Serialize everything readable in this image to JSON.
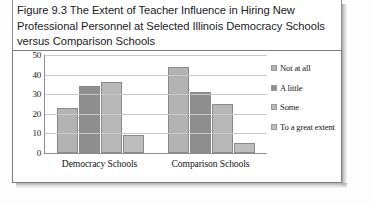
{
  "figure": {
    "caption": "Figure 9.3 The Extent of Teacher Influence in Hiring New Professional Personnel at Selected Illinois Democracy Schools versus Comparison Schools"
  },
  "chart_data": {
    "type": "bar",
    "title": "Figure 9.3 The Extent of Teacher Influence in Hiring New Professional Personnel at Selected Illinois Democracy Schools versus Comparison Schools",
    "xlabel": "",
    "ylabel": "",
    "categories": [
      "Democracy Schools",
      "Comparison Schools"
    ],
    "series": [
      {
        "name": "Not at all",
        "values": [
          23,
          44
        ],
        "color": "#b3b3b3"
      },
      {
        "name": "A little",
        "values": [
          34,
          31
        ],
        "color": "#8e8e8e"
      },
      {
        "name": "Some",
        "values": [
          36,
          25
        ],
        "color": "#b8b8b8"
      },
      {
        "name": "To a great extent",
        "values": [
          9,
          5
        ],
        "color": "#bdbdbd"
      }
    ],
    "ylim": [
      0,
      50
    ],
    "yticks": [
      0,
      10,
      20,
      30,
      40,
      50
    ],
    "ytick_labels": [
      "0",
      "10",
      "20",
      "30",
      "40",
      "50"
    ],
    "grid": true,
    "grid_axis": "y",
    "legend_position": "right"
  },
  "colors": {
    "panel_border": "#7d7d7d",
    "axis": "#8e8e8e",
    "gridline": "#c9c9c9",
    "text": "#1c1c1c",
    "background": "#ffffff"
  }
}
